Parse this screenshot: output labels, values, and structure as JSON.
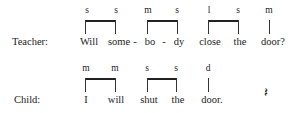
{
  "teacher": {
    "speaker": "Teacher:",
    "words": [
      "Will",
      "some",
      "-",
      "bo",
      "-",
      "dy",
      "close",
      "the",
      "door?"
    ],
    "labels": [
      "s",
      "s",
      "m",
      "s",
      "l",
      "s",
      "m"
    ]
  },
  "child": {
    "speaker": "Child:",
    "words": [
      "I",
      "will",
      "shut",
      "the",
      "door."
    ],
    "labels": [
      "m",
      "m",
      "s",
      "s",
      "d"
    ]
  },
  "symbol": "𝄽"
}
